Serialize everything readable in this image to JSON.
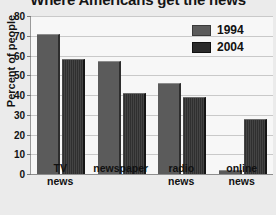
{
  "chart_data": {
    "type": "bar",
    "title": "Where Americans get the news",
    "xlabel": "",
    "ylabel": "Percent of people",
    "categories": [
      "TV news",
      "newspaper",
      "radio news",
      "online news"
    ],
    "category_lines": [
      [
        "TV",
        "news"
      ],
      [
        "newspaper"
      ],
      [
        "radio",
        "news"
      ],
      [
        "online",
        "news"
      ]
    ],
    "series": [
      {
        "name": "1994",
        "values": [
          71,
          57,
          46,
          2
        ],
        "color": "#5b5b5b"
      },
      {
        "name": "2004",
        "values": [
          58,
          41,
          39,
          28
        ],
        "color": "#2f2f2f"
      }
    ],
    "ylim": [
      0,
      80
    ],
    "ytick_labels": [
      "80",
      "70",
      "60",
      "50",
      "40",
      "30",
      "20",
      "10",
      "0"
    ],
    "ytick_values": [
      80,
      70,
      60,
      50,
      40,
      30,
      20,
      10,
      0
    ],
    "grid": true,
    "legend_position": "top-right"
  }
}
